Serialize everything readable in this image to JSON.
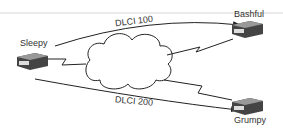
{
  "diagram": {
    "nodes": [
      {
        "id": "sleepy",
        "label": "Sleepy"
      },
      {
        "id": "bashful",
        "label": "Bashful"
      },
      {
        "id": "grumpy",
        "label": "Grumpy"
      }
    ],
    "cloud": {
      "label": ""
    },
    "vcs": [
      {
        "label": "DLCI 100",
        "from": "Sleepy",
        "to": "Bashful"
      },
      {
        "label": "DLCI 200",
        "from": "Sleepy",
        "to": "Grumpy"
      }
    ]
  }
}
